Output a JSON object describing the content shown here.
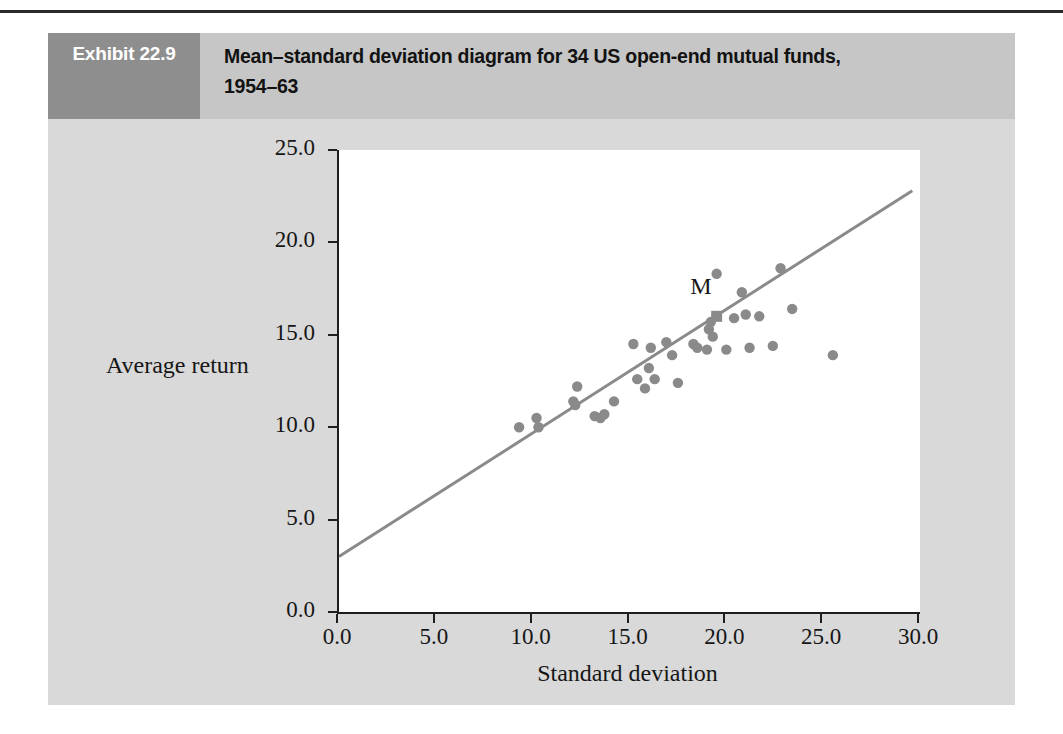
{
  "exhibit": {
    "number_label": "Exhibit 22.9",
    "title": "Mean–standard deviation diagram for 34 US open-end mutual funds, 1954–63",
    "header_number_bg": "#8e8e8e",
    "header_title_bg": "#c6c6c6",
    "panel_bg": "#d9d9d9"
  },
  "chart_data": {
    "type": "scatter",
    "title": "Mean–standard deviation diagram for 34 US open-end mutual funds, 1954–63",
    "xlabel": "Standard deviation",
    "ylabel": "Average return",
    "xlim": [
      0.0,
      30.0
    ],
    "ylim": [
      0.0,
      25.0
    ],
    "xticks": [
      0.0,
      5.0,
      10.0,
      15.0,
      20.0,
      25.0,
      30.0
    ],
    "yticks": [
      0.0,
      5.0,
      10.0,
      15.0,
      20.0,
      25.0
    ],
    "xticklabels": [
      "0.0",
      "5.0",
      "10.0",
      "15.0",
      "20.0",
      "25.0",
      "30.0"
    ],
    "yticklabels": [
      "0.0",
      "5.0",
      "10.0",
      "15.0",
      "20.0",
      "25.0"
    ],
    "grid": false,
    "legend": null,
    "point_color": "#8a8a8a",
    "line_color": "#8a8a8a",
    "marker_radius": 5.2,
    "series": [
      {
        "name": "US open-end mutual funds",
        "marker": "circle",
        "points": [
          [
            9.3,
            10.0
          ],
          [
            10.2,
            10.5
          ],
          [
            10.3,
            10.0
          ],
          [
            12.1,
            11.4
          ],
          [
            12.2,
            11.2
          ],
          [
            12.3,
            12.2
          ],
          [
            13.2,
            10.6
          ],
          [
            13.5,
            10.5
          ],
          [
            13.7,
            10.7
          ],
          [
            14.2,
            11.4
          ],
          [
            15.2,
            14.5
          ],
          [
            15.4,
            12.6
          ],
          [
            15.8,
            12.1
          ],
          [
            16.0,
            13.2
          ],
          [
            16.1,
            14.3
          ],
          [
            16.3,
            12.6
          ],
          [
            16.9,
            14.6
          ],
          [
            17.2,
            13.9
          ],
          [
            17.5,
            12.4
          ],
          [
            18.3,
            14.5
          ],
          [
            18.5,
            14.3
          ],
          [
            19.0,
            14.2
          ],
          [
            19.1,
            15.3
          ],
          [
            19.2,
            15.7
          ],
          [
            19.3,
            14.9
          ],
          [
            19.5,
            18.3
          ],
          [
            20.0,
            14.2
          ],
          [
            20.4,
            15.9
          ],
          [
            20.8,
            17.3
          ],
          [
            21.0,
            16.1
          ],
          [
            21.2,
            14.3
          ],
          [
            21.7,
            16.0
          ],
          [
            22.4,
            14.4
          ],
          [
            22.8,
            18.6
          ],
          [
            23.4,
            16.4
          ],
          [
            25.5,
            13.9
          ]
        ]
      }
    ],
    "annotations": [
      {
        "label": "M",
        "x": 19.5,
        "y": 16.0,
        "marker": "square",
        "label_dx": -0.9,
        "label_dy": 1.5
      }
    ],
    "line": {
      "name": "capital market line",
      "x0": 0.0,
      "y0": 3.0,
      "x1": 29.6,
      "y1": 22.8
    }
  }
}
